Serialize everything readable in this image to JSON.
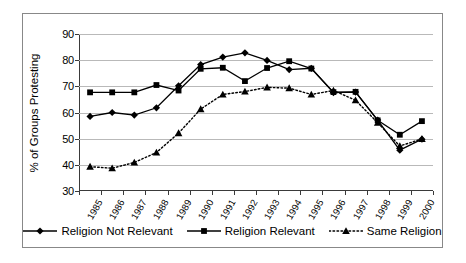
{
  "chart_data": {
    "type": "line",
    "title": "",
    "xlabel": "",
    "ylabel": "% of Groups Protesting",
    "categories": [
      "1985",
      "1986",
      "1987",
      "1988",
      "1989",
      "1990",
      "1991",
      "1992",
      "1993",
      "1994",
      "1995",
      "1996",
      "1997",
      "1998",
      "1999",
      "2000"
    ],
    "ylim": [
      30,
      90
    ],
    "yticks": [
      30,
      40,
      50,
      60,
      70,
      80,
      90
    ],
    "grid": true,
    "legend_position": "bottom",
    "series": [
      {
        "name": "Religion Not Relevant",
        "marker": "diamond",
        "line_style": "solid",
        "color": "#000000",
        "values": [
          58.5,
          60.0,
          59.0,
          61.8,
          70.2,
          78.3,
          81.2,
          82.8,
          79.9,
          76.4,
          76.9,
          67.6,
          67.8,
          57.1,
          45.6,
          49.8
        ]
      },
      {
        "name": "Religion Relevant",
        "marker": "square",
        "line_style": "solid",
        "color": "#000000",
        "values": [
          67.7,
          67.7,
          67.7,
          70.5,
          68.4,
          76.7,
          77.1,
          72.0,
          77.0,
          79.6,
          76.8,
          67.8,
          67.9,
          57.0,
          51.5,
          56.7
        ]
      },
      {
        "name": "Same Religion",
        "marker": "triangle",
        "line_style": "dotted",
        "color": "#000000",
        "values": [
          39.3,
          38.7,
          40.9,
          44.7,
          52.1,
          61.3,
          66.9,
          68.0,
          69.6,
          69.3,
          66.9,
          68.4,
          64.7,
          56.1,
          47.2,
          49.9
        ]
      }
    ]
  },
  "legend": {
    "items": [
      {
        "label": "Religion Not Relevant",
        "marker": "diamond",
        "style": "solid"
      },
      {
        "label": "Religion Relevant",
        "marker": "square",
        "style": "solid"
      },
      {
        "label": "Same Religion",
        "marker": "triangle",
        "style": "dotted"
      }
    ]
  }
}
